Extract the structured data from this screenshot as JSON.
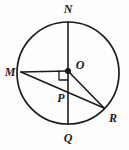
{
  "figure": {
    "background_color": "#fdfdfd",
    "stroke_color": "#1b1b1b",
    "canvas": {
      "width": 129,
      "height": 150
    },
    "circle": {
      "cx": 68,
      "cy": 73,
      "r": 51
    },
    "points": [
      {
        "id": "N",
        "label": "N",
        "x": 68,
        "y": 22,
        "label_x": 68,
        "label_y": 10,
        "on_circle": true
      },
      {
        "id": "M",
        "label": "M",
        "x": 21,
        "y": 72,
        "label_x": 10,
        "label_y": 73,
        "on_circle": true
      },
      {
        "id": "O",
        "label": "O",
        "x": 68,
        "y": 71,
        "label_x": 80,
        "label_y": 66,
        "on_circle": false
      },
      {
        "id": "P",
        "label": "P",
        "x": 68,
        "y": 97,
        "label_x": 61,
        "label_y": 99,
        "on_circle": false
      },
      {
        "id": "Q",
        "label": "Q",
        "x": 68,
        "y": 124,
        "label_x": 68,
        "label_y": 139,
        "on_circle": true
      },
      {
        "id": "R",
        "label": "R",
        "x": 104,
        "y": 108,
        "label_x": 113,
        "label_y": 119,
        "on_circle": true
      }
    ],
    "segments": [
      {
        "id": "NQ",
        "name": "diameter-nq",
        "kind": "diameter",
        "from": "N",
        "to": "Q"
      },
      {
        "id": "MO",
        "name": "radius-mo",
        "kind": "radius",
        "from": "M",
        "to": "O"
      },
      {
        "id": "OR",
        "name": "radius-or",
        "kind": "radius",
        "from": "O",
        "to": "R"
      },
      {
        "id": "MR",
        "name": "chord-mr",
        "kind": "chord",
        "from": "M",
        "to": "R"
      }
    ],
    "right_angle": {
      "name": "right-angle-mark-at-o",
      "vertex": "O",
      "size": 9,
      "direction": "lower-left",
      "description": "square mark between OM and OQ"
    }
  }
}
